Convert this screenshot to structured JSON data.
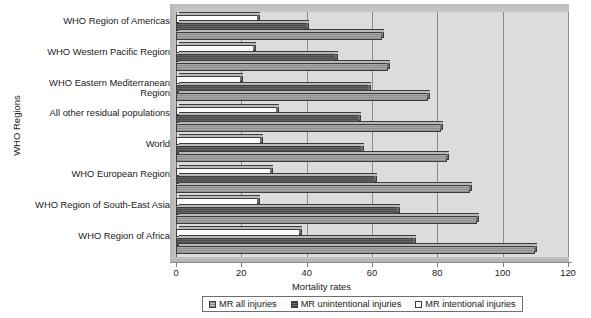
{
  "chart_data": {
    "type": "bar",
    "orientation": "horizontal",
    "title": "",
    "xlabel": "Mortality rates",
    "ylabel": "WHO Regions",
    "xlim": [
      0,
      120
    ],
    "xticks": [
      0,
      20,
      40,
      60,
      80,
      100,
      120
    ],
    "grid": true,
    "legend_position": "bottom",
    "categories": [
      "WHO Region of Americas",
      "WHO Western Pacific Region",
      "WHO Eastern Mediterranean Region",
      "All other residual populations",
      "World",
      "WHO European Region",
      "WHO Region of South-East Asia",
      "WHO Region of Africa"
    ],
    "series": [
      {
        "name": "MR all injuries",
        "color": "#9a9a9a",
        "values": [
          63,
          65,
          77,
          81,
          83,
          90,
          92,
          110
        ]
      },
      {
        "name": "MR unintentional injuries",
        "color": "#565656",
        "values": [
          40,
          49,
          59,
          56,
          57,
          61,
          68,
          73
        ]
      },
      {
        "name": "MR intentional injuries",
        "color": "#ffffff",
        "values": [
          25,
          24,
          20,
          31,
          26,
          29,
          25,
          38
        ]
      }
    ]
  },
  "axes": {
    "x_title": "Mortality rates",
    "y_title": "WHO Regions",
    "x_tick_labels": [
      "0",
      "20",
      "40",
      "60",
      "80",
      "100",
      "120"
    ]
  },
  "legend": {
    "entries": [
      {
        "label": "MR all injuries",
        "swatch": "all"
      },
      {
        "label": "MR unintentional injuries",
        "swatch": "unint"
      },
      {
        "label": "MR intentional injuries",
        "swatch": "intent"
      }
    ]
  }
}
